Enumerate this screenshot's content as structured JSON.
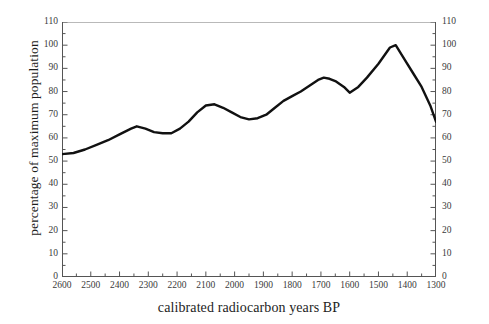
{
  "chart_data": {
    "type": "line",
    "title": "",
    "xlabel": "calibrated radiocarbon years BP",
    "ylabel": "percentage of maximum population",
    "xlim": [
      2600,
      1300
    ],
    "ylim": [
      0,
      110
    ],
    "x_reversed": true,
    "grid": false,
    "legend": null,
    "line_color": "#111111",
    "background_color": "#ffffff",
    "axis_color": "#555555",
    "top_border_color": "#b9b9b9",
    "x_major_ticks": [
      2600,
      2500,
      2400,
      2300,
      2200,
      2100,
      2000,
      1900,
      1800,
      1700,
      1600,
      1500,
      1400,
      1300
    ],
    "x_tick_labels": [
      "2600",
      "2500",
      "2400",
      "2300",
      "2200",
      "2100",
      "2000",
      "1900",
      "1800",
      "1700",
      "1600",
      "1500",
      "1400",
      "1300"
    ],
    "x_minor_tick_interval": 50,
    "y_major_ticks": [
      0,
      10,
      20,
      30,
      40,
      50,
      60,
      70,
      80,
      90,
      100,
      110
    ],
    "y_tick_labels": [
      "0",
      "10",
      "20",
      "30",
      "40",
      "50",
      "60",
      "70",
      "80",
      "90",
      "100",
      "110"
    ],
    "y_minor_tick_interval": 5,
    "y_axis_left_labels": [
      "0",
      "10",
      "20",
      "30",
      "40",
      "50",
      "60",
      "70",
      "80",
      "90",
      "100",
      "110"
    ],
    "y_axis_right_labels": [
      "0",
      "10",
      "20",
      "30",
      "40",
      "50",
      "60",
      "70",
      "80",
      "90",
      "100",
      "110"
    ],
    "series": [
      {
        "name": "percentage of maximum population",
        "x": [
          2600,
          2560,
          2520,
          2480,
          2440,
          2400,
          2360,
          2340,
          2310,
          2280,
          2250,
          2220,
          2190,
          2160,
          2130,
          2100,
          2070,
          2040,
          2010,
          1980,
          1950,
          1920,
          1890,
          1860,
          1830,
          1800,
          1770,
          1740,
          1710,
          1690,
          1670,
          1650,
          1620,
          1600,
          1570,
          1540,
          1500,
          1460,
          1440,
          1410,
          1380,
          1350,
          1320,
          1300
        ],
        "y": [
          53,
          53.5,
          55,
          57,
          59,
          61.5,
          64,
          65,
          64,
          62.5,
          62,
          62,
          64,
          67,
          71,
          74,
          74.5,
          73,
          71,
          69,
          68,
          68.5,
          70,
          73,
          76,
          78,
          80,
          82.5,
          85,
          86,
          85.5,
          84.5,
          82,
          79.5,
          82,
          86,
          92,
          99,
          100,
          94,
          88,
          82,
          74,
          67
        ]
      }
    ]
  }
}
